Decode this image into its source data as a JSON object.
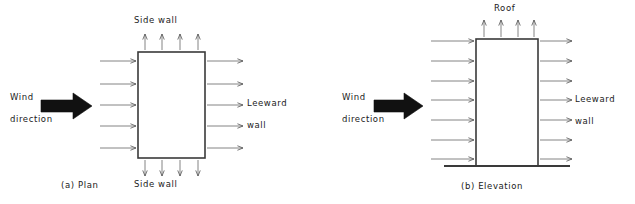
{
  "figure": {
    "width": 635,
    "height": 204,
    "background": "#ffffff",
    "line_color": "#3a3a3a",
    "arrow_color": "#555555",
    "block_arrow_color": "#111111",
    "text_color": "#1a1a1a"
  },
  "panels": [
    {
      "id": "plan",
      "caption": "(a)  Plan",
      "labels": {
        "top": "Side wall",
        "bottom": "Side wall",
        "wind_line1": "Wind",
        "wind_line2": "direction",
        "leeward_line1": "Leeward",
        "leeward_line2": "wall"
      },
      "arrow_counts": {
        "windward": 5,
        "leeward": 5,
        "top": 4,
        "bottom": 4
      },
      "building": {
        "x": 138,
        "y": 52,
        "width": 67,
        "height": 106
      }
    },
    {
      "id": "elevation",
      "caption": "(b)  Elevation",
      "labels": {
        "top": "Roof",
        "wind_line1": "Wind",
        "wind_line2": "direction",
        "leeward_line1": "Leeward",
        "leeward_line2": "wall"
      },
      "arrow_counts": {
        "windward": 7,
        "leeward": 7,
        "roof": 4
      },
      "building": {
        "x": 158,
        "y": 39,
        "width": 62,
        "height": 127
      },
      "ground_line": {
        "x1": 126,
        "x2": 252,
        "y": 166
      }
    }
  ]
}
